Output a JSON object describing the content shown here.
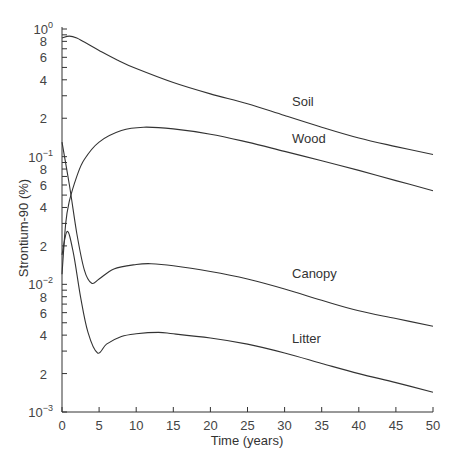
{
  "chart_data": {
    "type": "line",
    "title": "",
    "xlabel": "Time (years)",
    "ylabel": "Strontium-90 (%)",
    "xlim": [
      0,
      50
    ],
    "ylim": [
      0.001,
      1
    ],
    "yscale": "log",
    "grid": false,
    "legend": "inline labels",
    "x_ticks": [
      0,
      5,
      10,
      15,
      20,
      25,
      30,
      35,
      40,
      45,
      50
    ],
    "x_tick_labels": [
      "0",
      "5",
      "10",
      "15",
      "20",
      "25",
      "30",
      "35",
      "40",
      "45",
      "50"
    ],
    "y_decades": [
      {
        "value": 1,
        "base": "10",
        "exp": "0"
      },
      {
        "value": 0.1,
        "base": "10",
        "exp": "−1"
      },
      {
        "value": 0.01,
        "base": "10",
        "exp": "−2"
      },
      {
        "value": 0.001,
        "base": "10",
        "exp": "−3"
      }
    ],
    "y_minor_labels": [
      "2",
      "4",
      "6",
      "8"
    ],
    "series": [
      {
        "name": "Soil",
        "label_pos": {
          "t": 31,
          "v": 0.25
        },
        "points": [
          [
            0,
            0.85
          ],
          [
            1,
            0.88
          ],
          [
            2,
            0.85
          ],
          [
            3,
            0.79
          ],
          [
            5,
            0.68
          ],
          [
            7.5,
            0.57
          ],
          [
            10,
            0.49
          ],
          [
            15,
            0.38
          ],
          [
            20,
            0.31
          ],
          [
            25,
            0.26
          ],
          [
            30,
            0.21
          ],
          [
            35,
            0.17
          ],
          [
            40,
            0.14
          ],
          [
            45,
            0.12
          ],
          [
            50,
            0.104
          ]
        ]
      },
      {
        "name": "Wood",
        "label_pos": {
          "t": 31,
          "v": 0.128
        },
        "points": [
          [
            0,
            0.012
          ],
          [
            0.5,
            0.03
          ],
          [
            1,
            0.045
          ],
          [
            2,
            0.07
          ],
          [
            3,
            0.095
          ],
          [
            5,
            0.13
          ],
          [
            8,
            0.16
          ],
          [
            11,
            0.17
          ],
          [
            15,
            0.165
          ],
          [
            20,
            0.15
          ],
          [
            25,
            0.13
          ],
          [
            30,
            0.11
          ],
          [
            35,
            0.093
          ],
          [
            40,
            0.078
          ],
          [
            45,
            0.065
          ],
          [
            50,
            0.054
          ]
        ]
      },
      {
        "name": "Canopy",
        "label_pos": {
          "t": 31,
          "v": 0.0112
        },
        "points": [
          [
            0,
            0.13
          ],
          [
            1,
            0.06
          ],
          [
            2,
            0.025
          ],
          [
            3,
            0.013
          ],
          [
            4,
            0.0102
          ],
          [
            5,
            0.011
          ],
          [
            7,
            0.0132
          ],
          [
            10,
            0.0143
          ],
          [
            12,
            0.0145
          ],
          [
            15,
            0.014
          ],
          [
            20,
            0.0126
          ],
          [
            25,
            0.011
          ],
          [
            30,
            0.0092
          ],
          [
            35,
            0.0075
          ],
          [
            40,
            0.0062
          ],
          [
            45,
            0.0054
          ],
          [
            50,
            0.0047
          ]
        ]
      },
      {
        "name": "Litter",
        "label_pos": {
          "t": 31,
          "v": 0.0035
        },
        "points": [
          [
            0,
            0.017
          ],
          [
            0.7,
            0.026
          ],
          [
            1.5,
            0.018
          ],
          [
            2.5,
            0.008
          ],
          [
            3.5,
            0.0042
          ],
          [
            4.8,
            0.0029
          ],
          [
            6,
            0.0034
          ],
          [
            8,
            0.0039
          ],
          [
            10,
            0.0041
          ],
          [
            13,
            0.0042
          ],
          [
            15,
            0.0041
          ],
          [
            20,
            0.0038
          ],
          [
            25,
            0.0034
          ],
          [
            30,
            0.0029
          ],
          [
            35,
            0.0024
          ],
          [
            40,
            0.002
          ],
          [
            45,
            0.0017
          ],
          [
            50,
            0.00143
          ]
        ]
      }
    ]
  }
}
